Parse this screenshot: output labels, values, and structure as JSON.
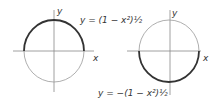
{
  "figure": {
    "left_panel": {
      "axis_x_label": "x",
      "axis_y_label": "y",
      "equation": "y = (1 − x²)½",
      "highlight": "upper semicircle"
    },
    "right_panel": {
      "axis_x_label": "x",
      "axis_y_label": "y",
      "equation": "y = −(1 − x²)½",
      "highlight": "lower semicircle"
    },
    "colors": {
      "thin_line": "#888888",
      "bold_line": "#333333",
      "text": "#333333"
    }
  }
}
